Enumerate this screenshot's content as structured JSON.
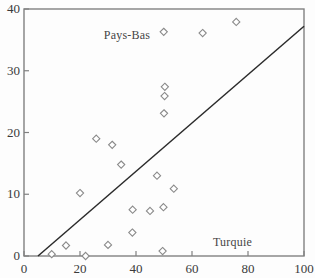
{
  "chart_data": {
    "type": "scatter",
    "title": "",
    "xlabel": "",
    "ylabel": "",
    "xlim": [
      0,
      100
    ],
    "ylim": [
      0,
      40
    ],
    "grid": false,
    "legend": "none",
    "xticks": [
      0,
      20,
      40,
      60,
      80,
      100
    ],
    "yticks": [
      0,
      10,
      20,
      30,
      40
    ],
    "xtick_labels": [
      "0",
      "20",
      "40",
      "60",
      "80",
      "100"
    ],
    "ytick_labels": [
      "0",
      "10",
      "20",
      "30",
      "40"
    ],
    "marker": "diamond-open",
    "marker_color": "#8a8a8a",
    "marker_fill": "#ffffff",
    "line_color": "#2b2b2b",
    "frame_color": "#808080",
    "points": [
      {
        "x": 9.9,
        "y": 0.3
      },
      {
        "x": 15.0,
        "y": 1.7
      },
      {
        "x": 20.0,
        "y": 10.2
      },
      {
        "x": 22.0,
        "y": 0.0
      },
      {
        "x": 25.8,
        "y": 19.0
      },
      {
        "x": 30.0,
        "y": 1.8
      },
      {
        "x": 31.5,
        "y": 18.0
      },
      {
        "x": 34.7,
        "y": 14.8
      },
      {
        "x": 38.7,
        "y": 3.8
      },
      {
        "x": 38.8,
        "y": 7.5
      },
      {
        "x": 45.0,
        "y": 7.3
      },
      {
        "x": 47.5,
        "y": 13.0
      },
      {
        "x": 49.5,
        "y": 0.8
      },
      {
        "x": 49.8,
        "y": 7.9
      },
      {
        "x": 49.9,
        "y": 36.3
      },
      {
        "x": 50.0,
        "y": 23.1
      },
      {
        "x": 50.2,
        "y": 25.9
      },
      {
        "x": 50.3,
        "y": 27.4
      },
      {
        "x": 53.5,
        "y": 10.9
      },
      {
        "x": 63.8,
        "y": 36.1
      },
      {
        "x": 75.8,
        "y": 37.9
      }
    ],
    "reference_line": {
      "x0": 5.0,
      "y0": 0.0,
      "x1": 100.0,
      "y1": 37.2
    },
    "annotations": [
      {
        "text": "Pays-Bas",
        "x": 28.5,
        "y": 35.8
      },
      {
        "text": "Turquie",
        "x": 67.5,
        "y": 2.2
      }
    ]
  }
}
